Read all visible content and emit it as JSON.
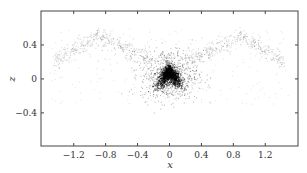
{
  "chart_data": {
    "type": "scatter",
    "title": "",
    "xlabel": "x",
    "ylabel": "z",
    "xlim": [
      -1.61,
      1.61
    ],
    "ylim": [
      -0.79,
      0.8
    ],
    "xticks": [
      -1.2,
      -0.8,
      -0.4,
      0,
      0.4,
      0.8,
      1.2
    ],
    "xtick_labels": [
      "−1.2",
      "−0.8",
      "−0.4",
      "0",
      "0.4",
      "0.8",
      "1.2"
    ],
    "yticks": [
      -0.4,
      0,
      0.4
    ],
    "ytick_labels": [
      "−0.4",
      "0",
      "0.4"
    ],
    "grid": false,
    "legend": null,
    "point_color": "#000000",
    "components": [
      {
        "name": "core-chevron",
        "count": 1400,
        "center": [
          0.0,
          0.0
        ],
        "apex_z": 0.1,
        "arm_slope": 0.9,
        "spread": 0.05,
        "alpha": 0.55
      },
      {
        "name": "halo",
        "count": 700,
        "center": [
          0.0,
          0.05
        ],
        "sx": 0.18,
        "sz": 0.15,
        "alpha": 0.3
      },
      {
        "name": "wings",
        "count": 900,
        "x_range": [
          -1.45,
          1.45
        ],
        "peak_z": 0.5,
        "peak_x": 0.9,
        "spread": 0.05,
        "alpha": 0.18
      },
      {
        "name": "background",
        "count": 250,
        "x_range": [
          -1.5,
          1.5
        ],
        "z_range": [
          -0.3,
          0.6
        ],
        "alpha": 0.12
      }
    ]
  }
}
